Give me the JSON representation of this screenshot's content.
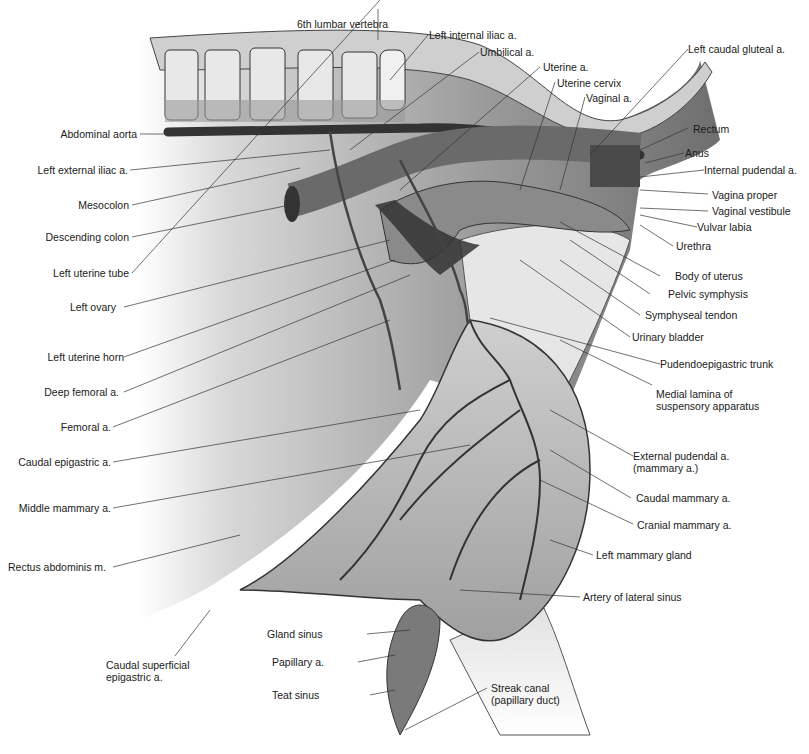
{
  "figure": {
    "colors": {
      "background": "#ffffff",
      "ink": "#1a1a1a",
      "tissue_light": "#d9d9d9",
      "tissue_mid": "#a8a8a8",
      "tissue_dark": "#5a5a5a",
      "vessel": "#3a3a3a"
    }
  },
  "labels_left": [
    {
      "id": "abdominal-aorta",
      "text": "Abdominal aorta"
    },
    {
      "id": "left-external-iliac",
      "text": "Left external iliac a."
    },
    {
      "id": "mesocolon",
      "text": "Mesocolon"
    },
    {
      "id": "descending-colon",
      "text": "Descending colon"
    },
    {
      "id": "left-uterine-tube",
      "text": "Left uterine tube"
    },
    {
      "id": "left-ovary",
      "text": "Left ovary"
    },
    {
      "id": "left-uterine-horn",
      "text": "Left uterine horn"
    },
    {
      "id": "deep-femoral",
      "text": "Deep femoral a."
    },
    {
      "id": "femoral",
      "text": "Femoral a."
    },
    {
      "id": "caudal-epigastric",
      "text": "Caudal epigastric a."
    },
    {
      "id": "middle-mammary",
      "text": "Middle mammary a."
    },
    {
      "id": "rectus-abdominis",
      "text": "Rectus abdominis m."
    },
    {
      "id": "caudal-superficial-epigastric",
      "text": "Caudal superficial\nepigastric a."
    }
  ],
  "labels_top": [
    {
      "id": "sixth-lumbar",
      "text": "6th lumbar vertebra"
    },
    {
      "id": "left-internal-iliac",
      "text": "Left internal iliac a."
    },
    {
      "id": "umbilical",
      "text": "Umbilical a."
    },
    {
      "id": "uterine-a",
      "text": "Uterine a."
    },
    {
      "id": "uterine-cervix",
      "text": "Uterine cervix"
    },
    {
      "id": "vaginal-a",
      "text": "Vaginal a."
    },
    {
      "id": "left-caudal-gluteal",
      "text": "Left caudal gluteal a."
    }
  ],
  "labels_right": [
    {
      "id": "rectum",
      "text": "Rectum"
    },
    {
      "id": "anus",
      "text": "Anus"
    },
    {
      "id": "internal-pudendal",
      "text": "Internal pudendal a."
    },
    {
      "id": "vagina-proper",
      "text": "Vagina proper"
    },
    {
      "id": "vaginal-vestibule",
      "text": "Vaginal vestibule"
    },
    {
      "id": "vulvar-labia",
      "text": "Vulvar labia"
    },
    {
      "id": "urethra",
      "text": "Urethra"
    },
    {
      "id": "body-of-uterus",
      "text": "Body of uterus"
    },
    {
      "id": "pelvic-symphysis",
      "text": "Pelvic symphysis"
    },
    {
      "id": "symphyseal-tendon",
      "text": "Symphyseal tendon"
    },
    {
      "id": "urinary-bladder",
      "text": "Urinary bladder"
    },
    {
      "id": "pudendoepigastric-trunk",
      "text": "Pudendoepigastric trunk"
    },
    {
      "id": "medial-lamina",
      "text": "Medial lamina of\nsuspensory apparatus"
    },
    {
      "id": "external-pudendal",
      "text": "External pudendal a.\n(mammary a.)"
    },
    {
      "id": "caudal-mammary",
      "text": "Caudal mammary a."
    },
    {
      "id": "cranial-mammary",
      "text": "Cranial mammary a."
    },
    {
      "id": "left-mammary-gland",
      "text": "Left mammary gland"
    },
    {
      "id": "artery-lateral-sinus",
      "text": "Artery of lateral sinus"
    }
  ],
  "labels_bottom": [
    {
      "id": "gland-sinus",
      "text": "Gland sinus"
    },
    {
      "id": "papillary-a",
      "text": "Papillary a."
    },
    {
      "id": "teat-sinus",
      "text": "Teat sinus"
    },
    {
      "id": "streak-canal",
      "text": "Streak canal\n(papillary duct)"
    }
  ]
}
